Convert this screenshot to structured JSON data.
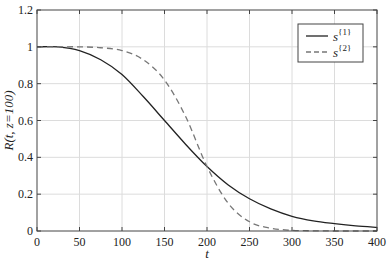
{
  "chart_data": {
    "type": "line",
    "title": "",
    "xlabel": "t",
    "ylabel": "R(t, z=100)",
    "xlim": [
      0,
      400
    ],
    "ylim": [
      0,
      1.2
    ],
    "xticks": [
      0,
      50,
      100,
      150,
      200,
      250,
      300,
      350,
      400
    ],
    "yticks": [
      0,
      0.2,
      0.4,
      0.6,
      0.8,
      1,
      1.2
    ],
    "ytick_labels": [
      "0",
      "0.2",
      "0.4",
      "0.6",
      "0.8",
      "1",
      "1.2"
    ],
    "grid": true,
    "legend_position": "upper right",
    "x": [
      0,
      25,
      50,
      75,
      100,
      125,
      150,
      175,
      200,
      225,
      250,
      275,
      300,
      325,
      350,
      375,
      400
    ],
    "series": [
      {
        "name": "s{1}",
        "label_base": "s",
        "label_sup": "{1}",
        "style": "solid",
        "color": "#222222",
        "values": [
          1,
          1,
          0.98,
          0.93,
          0.85,
          0.73,
          0.6,
          0.47,
          0.35,
          0.25,
          0.175,
          0.12,
          0.08,
          0.055,
          0.04,
          0.028,
          0.02
        ]
      },
      {
        "name": "s{2}",
        "label_base": "s",
        "label_sup": "{2}",
        "style": "dashed",
        "color": "#777777",
        "values": [
          1,
          1,
          1,
          0.995,
          0.98,
          0.93,
          0.82,
          0.62,
          0.35,
          0.15,
          0.05,
          0.015,
          0.004,
          0.001,
          0,
          0,
          0
        ]
      }
    ]
  }
}
